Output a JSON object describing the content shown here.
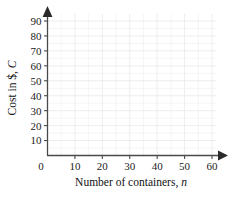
{
  "chart_data": {
    "type": "scatter",
    "title": "",
    "subtitle": "",
    "xlabel_text": "Number of containers, ",
    "xlabel_var": "n",
    "ylabel_text": "Cost in $, ",
    "ylabel_var": "C",
    "x": [],
    "values": [],
    "series": [],
    "annotations": [],
    "legend": [],
    "legend_position": "none",
    "grid": true,
    "grid_minor_step_x": 5,
    "grid_minor_step_y": 5,
    "xlim": [
      0,
      62
    ],
    "ylim": [
      0,
      95
    ],
    "x_tick_values": [
      0,
      10,
      20,
      30,
      40,
      50,
      60
    ],
    "y_tick_values": [
      10,
      20,
      30,
      40,
      50,
      60,
      70,
      80,
      90
    ],
    "origin_label": "0",
    "x_tick_labels": [
      "10",
      "20",
      "30",
      "40",
      "50",
      "60"
    ],
    "y_tick_labels": [
      "10",
      "20",
      "30",
      "40",
      "50",
      "60",
      "70",
      "80",
      "90"
    ],
    "axis_arrows": [
      "x-right",
      "y-up"
    ],
    "colors": {
      "axis": "#4a4a4a",
      "grid_minor": "#f1f1f3",
      "grid_major": "#e9e9ec",
      "text": "#1c1c1c",
      "arrow": "#2a2a2a",
      "background": "#ffffff"
    }
  }
}
